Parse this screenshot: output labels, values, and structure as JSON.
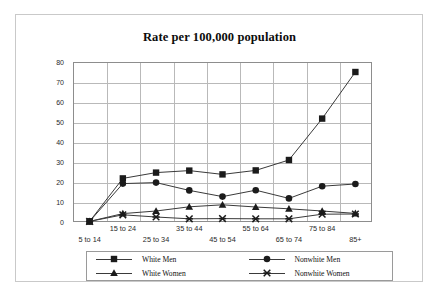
{
  "chart_data": {
    "type": "line",
    "title": "Rate per 100,000 population",
    "xlabel": "",
    "ylabel": "",
    "ylim": [
      0,
      80
    ],
    "yticks": [
      0,
      10,
      20,
      30,
      40,
      50,
      60,
      70,
      80
    ],
    "grid": true,
    "legend_position": "bottom",
    "categories": [
      "5 to 14",
      "15 to 24",
      "25 to 34",
      "35 to 44",
      "45 to 54",
      "55 to 64",
      "65 to 74",
      "75 to 84",
      "85+"
    ],
    "series": [
      {
        "name": "White Men",
        "marker": "square",
        "values": [
          0.3,
          21.8,
          24.7,
          25.7,
          23.8,
          25.8,
          31.0,
          51.7,
          75.0
        ]
      },
      {
        "name": "White Women",
        "marker": "triangle",
        "values": [
          0.3,
          4.2,
          5.5,
          7.6,
          8.6,
          7.5,
          6.6,
          5.5,
          4.3
        ]
      },
      {
        "name": "Nonwhite Men",
        "marker": "circle",
        "values": [
          0.3,
          19.2,
          19.7,
          15.8,
          12.7,
          15.9,
          11.8,
          17.9,
          19.0
        ]
      },
      {
        "name": "Nonwhite Women",
        "marker": "x",
        "values": [
          0.3,
          3.6,
          2.5,
          1.6,
          1.7,
          1.6,
          1.6,
          3.9,
          4.0
        ]
      }
    ]
  },
  "legend": {
    "items": [
      {
        "label": "White Men",
        "marker": "square"
      },
      {
        "label": "White Women",
        "marker": "triangle"
      },
      {
        "label": "Nonwhite Men",
        "marker": "circle"
      },
      {
        "label": "Nonwhite Women",
        "marker": "x"
      }
    ]
  },
  "colors": {
    "series": "#1b1b1b",
    "line": "#3a3a3a",
    "grid": "#b9b9b9",
    "axis": "#8d8d8d",
    "frame": "#c9c9c9",
    "text": "#111111"
  }
}
